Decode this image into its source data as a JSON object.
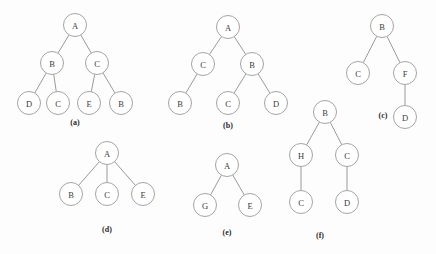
{
  "figure": {
    "background_color": "#fdfdfd",
    "node_fill": "#ffffff",
    "node_stroke": "#9a9a9a",
    "edge_color": "#8f8f8f",
    "text_color": "#3a3a3a",
    "caption_color": "#2b2b2b",
    "node_radius_x": 11.5,
    "node_radius_y": 11.5
  },
  "subfigures": [
    {
      "id": "a",
      "caption": "(a)",
      "caption_pos": {
        "x": 75,
        "y": 122
      },
      "nodes": [
        {
          "id": "a-root-A",
          "label": "A",
          "x": 75,
          "y": 25
        },
        {
          "id": "a-B",
          "label": "B",
          "x": 52,
          "y": 63
        },
        {
          "id": "a-C",
          "label": "C",
          "x": 97,
          "y": 63
        },
        {
          "id": "a-D",
          "label": "D",
          "x": 29,
          "y": 103
        },
        {
          "id": "a-C2",
          "label": "C",
          "x": 58,
          "y": 103
        },
        {
          "id": "a-E",
          "label": "E",
          "x": 89,
          "y": 103
        },
        {
          "id": "a-B2",
          "label": "B",
          "x": 121,
          "y": 103
        }
      ],
      "edges": [
        {
          "from": "a-root-A",
          "to": "a-B"
        },
        {
          "from": "a-root-A",
          "to": "a-C"
        },
        {
          "from": "a-B",
          "to": "a-D"
        },
        {
          "from": "a-B",
          "to": "a-C2"
        },
        {
          "from": "a-C",
          "to": "a-E"
        },
        {
          "from": "a-C",
          "to": "a-B2"
        }
      ]
    },
    {
      "id": "b",
      "caption": "(b)",
      "caption_pos": {
        "x": 228,
        "y": 125
      },
      "nodes": [
        {
          "id": "b-root-A",
          "label": "A",
          "x": 228,
          "y": 27
        },
        {
          "id": "b-C",
          "label": "C",
          "x": 203,
          "y": 64
        },
        {
          "id": "b-B",
          "label": "B",
          "x": 252,
          "y": 64
        },
        {
          "id": "b-B2",
          "label": "B",
          "x": 180,
          "y": 103
        },
        {
          "id": "b-C2",
          "label": "C",
          "x": 228,
          "y": 103
        },
        {
          "id": "b-D",
          "label": "D",
          "x": 276,
          "y": 103
        }
      ],
      "edges": [
        {
          "from": "b-root-A",
          "to": "b-C"
        },
        {
          "from": "b-root-A",
          "to": "b-B"
        },
        {
          "from": "b-C",
          "to": "b-B2"
        },
        {
          "from": "b-B",
          "to": "b-C2"
        },
        {
          "from": "b-B",
          "to": "b-D"
        }
      ]
    },
    {
      "id": "c",
      "caption": "(c)",
      "caption_pos": {
        "x": 383,
        "y": 115
      },
      "nodes": [
        {
          "id": "c-root-B",
          "label": "B",
          "x": 382,
          "y": 26
        },
        {
          "id": "c-C",
          "label": "C",
          "x": 358,
          "y": 73
        },
        {
          "id": "c-F",
          "label": "F",
          "x": 405,
          "y": 73
        },
        {
          "id": "c-D",
          "label": "D",
          "x": 405,
          "y": 117
        }
      ],
      "edges": [
        {
          "from": "c-root-B",
          "to": "c-C"
        },
        {
          "from": "c-root-B",
          "to": "c-F"
        },
        {
          "from": "c-F",
          "to": "c-D"
        }
      ]
    },
    {
      "id": "d",
      "caption": "(d)",
      "caption_pos": {
        "x": 107,
        "y": 229
      },
      "nodes": [
        {
          "id": "d-root-A",
          "label": "A",
          "x": 107,
          "y": 153
        },
        {
          "id": "d-B",
          "label": "B",
          "x": 71,
          "y": 194
        },
        {
          "id": "d-C",
          "label": "C",
          "x": 107,
          "y": 194
        },
        {
          "id": "d-E",
          "label": "E",
          "x": 143,
          "y": 194
        }
      ],
      "edges": [
        {
          "from": "d-root-A",
          "to": "d-B"
        },
        {
          "from": "d-root-A",
          "to": "d-C"
        },
        {
          "from": "d-root-A",
          "to": "d-E"
        }
      ]
    },
    {
      "id": "e",
      "caption": "(e)",
      "caption_pos": {
        "x": 227,
        "y": 232
      },
      "nodes": [
        {
          "id": "e-root-A",
          "label": "A",
          "x": 227,
          "y": 165
        },
        {
          "id": "e-G",
          "label": "G",
          "x": 205,
          "y": 205
        },
        {
          "id": "e-E",
          "label": "E",
          "x": 250,
          "y": 205
        }
      ],
      "edges": [
        {
          "from": "e-root-A",
          "to": "e-G"
        },
        {
          "from": "e-root-A",
          "to": "e-E"
        }
      ]
    },
    {
      "id": "f",
      "caption": "(f)",
      "caption_pos": {
        "x": 320,
        "y": 235
      },
      "nodes": [
        {
          "id": "f-root-B",
          "label": "B",
          "x": 325,
          "y": 112
        },
        {
          "id": "f-H",
          "label": "H",
          "x": 301,
          "y": 155
        },
        {
          "id": "f-C",
          "label": "C",
          "x": 347,
          "y": 155
        },
        {
          "id": "f-C2",
          "label": "C",
          "x": 301,
          "y": 202
        },
        {
          "id": "f-D",
          "label": "D",
          "x": 347,
          "y": 202
        }
      ],
      "edges": [
        {
          "from": "f-root-B",
          "to": "f-H"
        },
        {
          "from": "f-root-B",
          "to": "f-C"
        },
        {
          "from": "f-H",
          "to": "f-C2"
        },
        {
          "from": "f-C",
          "to": "f-D"
        }
      ]
    }
  ]
}
